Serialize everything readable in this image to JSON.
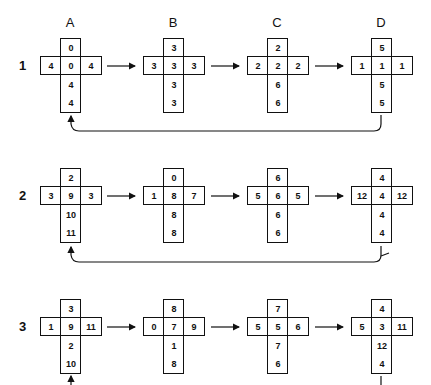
{
  "columns": [
    "A",
    "B",
    "C",
    "D"
  ],
  "rows": [
    {
      "label": "1",
      "crosses": [
        {
          "top": "0",
          "left": "4",
          "center": "0",
          "right": "4",
          "below1": "4",
          "below2": "4"
        },
        {
          "top": "3",
          "left": "3",
          "center": "3",
          "right": "3",
          "below1": "3",
          "below2": "3"
        },
        {
          "top": "2",
          "left": "2",
          "center": "2",
          "right": "2",
          "below1": "6",
          "below2": "6"
        },
        {
          "top": "5",
          "left": "1",
          "center": "1",
          "right": "1",
          "below1": "5",
          "below2": "5"
        }
      ]
    },
    {
      "label": "2",
      "crosses": [
        {
          "top": "2",
          "left": "3",
          "center": "9",
          "right": "3",
          "below1": "10",
          "below2": "11"
        },
        {
          "top": "0",
          "left": "1",
          "center": "8",
          "right": "7",
          "below1": "8",
          "below2": "8"
        },
        {
          "top": "6",
          "left": "5",
          "center": "6",
          "right": "5",
          "below1": "6",
          "below2": "6"
        },
        {
          "top": "4",
          "left": "12",
          "center": "4",
          "right": "12",
          "below1": "4",
          "below2": "4"
        }
      ]
    },
    {
      "label": "3",
      "crosses": [
        {
          "top": "3",
          "left": "1",
          "center": "9",
          "right": "11",
          "below1": "2",
          "below2": "10"
        },
        {
          "top": "8",
          "left": "0",
          "center": "7",
          "right": "9",
          "below1": "1",
          "below2": "8"
        },
        {
          "top": "7",
          "left": "5",
          "center": "5",
          "right": "6",
          "below1": "7",
          "below2": "6"
        },
        {
          "top": "4",
          "left": "5",
          "center": "3",
          "right": "11",
          "below1": "12",
          "below2": "4"
        }
      ]
    }
  ]
}
